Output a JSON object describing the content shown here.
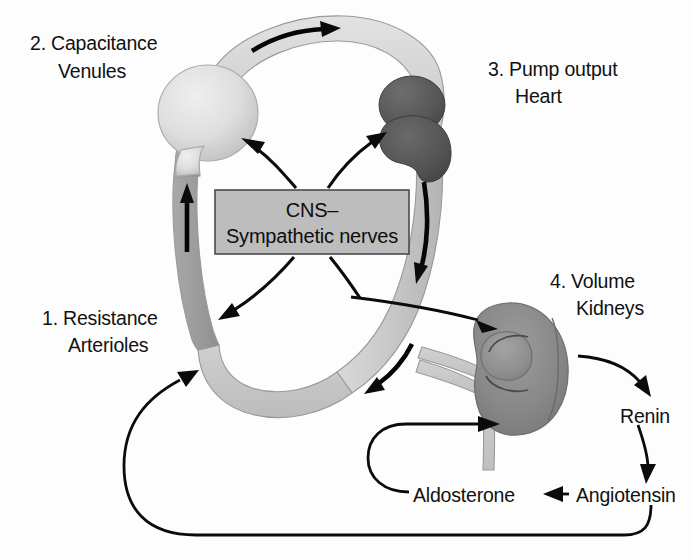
{
  "figure": {
    "background_color": "#fdfdfd"
  },
  "labels": {
    "capacitance": {
      "line1": "2. Capacitance",
      "line2": "Venules"
    },
    "pump": {
      "line1": "3. Pump output",
      "line2": "Heart"
    },
    "resistance": {
      "line1": "1. Resistance",
      "line2": "Arterioles"
    },
    "volume": {
      "line1": "4. Volume",
      "line2": "Kidneys"
    },
    "cns": {
      "line1": "CNS–",
      "line2": "Sympathetic nerves"
    },
    "renin": "Renin",
    "angiotensin": "Angiotensin",
    "aldosterone": "Aldosterone"
  },
  "colors": {
    "venule_light": "#d8d8d8",
    "venule_mid": "#c4c4c4",
    "artery_gray": "#9e9e9e",
    "heart_dark": "#5c5c5c",
    "kidney_gray": "#8a8a8a",
    "cns_box_fill": "#bdbdbd",
    "cns_box_stroke": "#4a4a4a",
    "arrow_black": "#0b0b0b",
    "text_black": "#111111"
  },
  "organs": {
    "venule_balloon": {
      "name": "capacitance venule balloon",
      "cx": 208,
      "cy": 113,
      "rx": 50,
      "ry": 48
    },
    "heart": {
      "name": "heart",
      "cx": 417,
      "cy": 123
    },
    "kidney": {
      "name": "kidney",
      "cx": 516,
      "cy": 366
    },
    "cns_box": {
      "x": 215,
      "y": 190,
      "w": 194,
      "h": 64
    }
  },
  "arrows": {
    "cns_to_venule": "CNS–Sympathetic nerves to capacitance venules",
    "cns_to_heart": "CNS–Sympathetic nerves to heart",
    "cns_to_arterioles": "CNS–Sympathetic nerves to resistance arterioles",
    "kidney_to_renin": "Kidneys produce Renin",
    "renin_to_angiotensin": "Renin to Angiotensin",
    "angiotensin_to_aldosterone": "Angiotensin to Aldosterone",
    "aldosterone_to_kidney": "Aldosterone acts on kidneys",
    "angiotensin_to_arterioles": "Angiotensin acts on resistance arterioles",
    "aorta_to_kidney": "Arterial flow to kidneys",
    "venous_return": "Venous return flow",
    "cardiac_output": "Cardiac output flow",
    "arterial_flow": "Arterial flow downward"
  }
}
